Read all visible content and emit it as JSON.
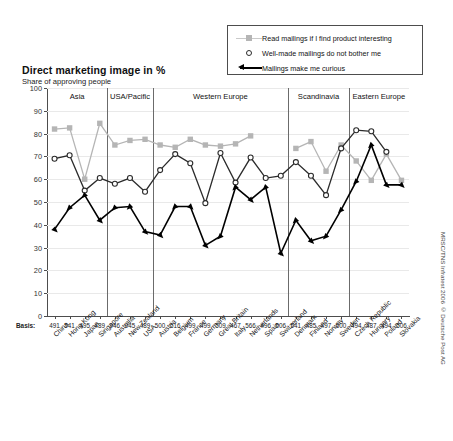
{
  "title": "Direct marketing image in %",
  "subtitle": "Share of approving people",
  "basis_word": "Basis:",
  "source": "MRSC/TNS Infratest 2006 © Deutsche Post AG",
  "caption": "",
  "legend": {
    "position": "top-right",
    "items": [
      {
        "label": "Read mailings if I find product interesting",
        "marker": "gray-square-line",
        "color": "#b5b5b5"
      },
      {
        "label": "Well-made mailings do not bother me",
        "marker": "open-circle",
        "color": "#2b2b2b"
      },
      {
        "label": "Mailings make me curious",
        "marker": "black-triangle-line",
        "color": "#000000"
      }
    ]
  },
  "chart_data": {
    "type": "line",
    "title": "Direct marketing image in %",
    "subtitle": "Share of approving people",
    "xlabel": "",
    "ylabel": "",
    "ylim": [
      0,
      100
    ],
    "yticks": [
      0,
      10,
      20,
      30,
      40,
      50,
      60,
      70,
      80,
      90,
      100
    ],
    "grid": true,
    "legend_position": "top-right",
    "categories": [
      "China",
      "Hong Kong",
      "Japan",
      "Singapore",
      "Australia",
      "New Zealand",
      "USA",
      "Austria",
      "Belgium",
      "France",
      "Germany",
      "Great Britain",
      "Italy",
      "Netherlands",
      "Spain",
      "Switzerland",
      "Denmark",
      "Finland",
      "Norway",
      "Sweden",
      "Czech Republic",
      "Hungary",
      "Poland",
      "Slovakia"
    ],
    "basis": [
      491,
      541,
      495,
      489,
      946,
      945,
      489,
      500,
      516,
      499,
      499,
      509,
      467,
      566,
      496,
      506,
      541,
      485,
      497,
      500,
      494,
      487,
      494,
      506
    ],
    "regions": [
      {
        "name": "Asia",
        "start": 0,
        "end": 3
      },
      {
        "name": "USA/Pacific",
        "start": 4,
        "end": 6
      },
      {
        "name": "Western Europe",
        "start": 7,
        "end": 15
      },
      {
        "name": "Scandinavia",
        "start": 16,
        "end": 19
      },
      {
        "name": "Eastern Europe",
        "start": 20,
        "end": 23
      }
    ],
    "series": [
      {
        "name": "Read mailings if I find product interesting",
        "color": "#b5b5b5",
        "marker": "square",
        "values": [
          82,
          82.5,
          60,
          84.5,
          75,
          77,
          77.5,
          75,
          74,
          77.5,
          75,
          74.5,
          75.5,
          79,
          null,
          null,
          73.5,
          76.5,
          63.5,
          75,
          68,
          59.5,
          71,
          59.5
        ]
      },
      {
        "name": "Well-made mailings do not bother me",
        "color": "#2b2b2b",
        "marker": "circle",
        "values": [
          69,
          70.5,
          55,
          60.5,
          58,
          60.5,
          54.5,
          64,
          71,
          67,
          49.5,
          71.5,
          58.5,
          69.5,
          60.5,
          61.5,
          67.5,
          61.5,
          53,
          73.5,
          81.5,
          81,
          72,
          null
        ]
      },
      {
        "name": "Mailings make me curious",
        "color": "#000000",
        "marker": "triangle",
        "values": [
          38,
          47.5,
          53,
          42,
          47.5,
          48,
          37,
          35.5,
          48,
          48,
          31,
          35,
          56.5,
          51,
          56.5,
          27.5,
          42,
          33,
          35,
          46.5,
          59,
          75,
          57.5,
          57.5
        ]
      }
    ]
  }
}
